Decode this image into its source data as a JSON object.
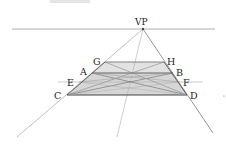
{
  "diagram": {
    "vanishing_point": {
      "label": "VP",
      "x": 143,
      "y": 29
    },
    "horizon": {
      "x1": 12,
      "x2": 215,
      "y": 29
    },
    "points": {
      "A": {
        "label": "A",
        "x": 92,
        "y": 73
      },
      "B": {
        "label": "B",
        "x": 173,
        "y": 73
      },
      "C": {
        "label": "C",
        "x": 67,
        "y": 95
      },
      "D": {
        "label": "D",
        "x": 187,
        "y": 95
      },
      "E": {
        "label": "E",
        "x": 79,
        "y": 82
      },
      "F": {
        "label": "F",
        "x": 180,
        "y": 82
      },
      "G": {
        "label": "G",
        "x": 105,
        "y": 62
      },
      "H": {
        "label": "H",
        "x": 164,
        "y": 62
      }
    },
    "colors": {
      "line": "#555555",
      "light_line": "#b5b5b5",
      "fill": "#d9d9d9",
      "text": "#222222"
    }
  }
}
